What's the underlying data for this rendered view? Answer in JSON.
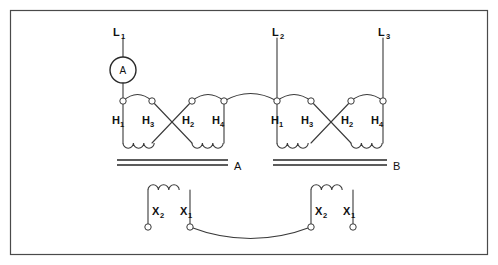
{
  "diagram": {
    "background_color": "#ffffff",
    "line_color": "#3a3a3a",
    "frame": {
      "x": 10,
      "y": 10,
      "width": 478,
      "height": 245
    },
    "line_labels": [
      {
        "name": "L1",
        "text": "L",
        "sub": "1",
        "x": 118,
        "y": 32
      },
      {
        "name": "L2",
        "text": "L",
        "sub": "2",
        "x": 277,
        "y": 32
      },
      {
        "name": "L3",
        "text": "L",
        "sub": "3",
        "x": 381,
        "y": 32
      }
    ],
    "meter": {
      "name": "ammeter",
      "label": "A",
      "cx": 123,
      "cy": 70,
      "r": 13
    },
    "transformers": [
      {
        "name": "transformer-a",
        "core_label": "A",
        "core_label_x": 234,
        "core_label_y": 170,
        "primary_terminals": [
          {
            "label": "H",
            "sub": "1",
            "x": 118,
            "y": 101
          },
          {
            "label": "H",
            "sub": "3",
            "x": 152,
            "y": 101
          },
          {
            "label": "H",
            "sub": "2",
            "x": 192,
            "y": 101
          },
          {
            "label": "H",
            "sub": "4",
            "x": 224,
            "y": 101
          }
        ],
        "secondary_terminals": [
          {
            "label": "X",
            "sub": "2",
            "x": 148,
            "y": 227
          },
          {
            "label": "X",
            "sub": "1",
            "x": 190,
            "y": 227
          }
        ]
      },
      {
        "name": "transformer-b",
        "core_label": "B",
        "core_label_x": 393,
        "core_label_y": 170,
        "primary_terminals": [
          {
            "label": "H",
            "sub": "1",
            "x": 277,
            "y": 101
          },
          {
            "label": "H",
            "sub": "3",
            "x": 311,
            "y": 101
          },
          {
            "label": "H",
            "sub": "2",
            "x": 351,
            "y": 101
          },
          {
            "label": "H",
            "sub": "4",
            "x": 383,
            "y": 101
          }
        ],
        "secondary_terminals": [
          {
            "label": "X",
            "sub": "2",
            "x": 311,
            "y": 227
          },
          {
            "label": "X",
            "sub": "1",
            "x": 353,
            "y": 227
          }
        ]
      }
    ],
    "labels": {
      "l1": "L",
      "l1_sub": "1",
      "l2": "L",
      "l2_sub": "2",
      "l3": "L",
      "l3_sub": "3",
      "meter": "A",
      "core_a": "A",
      "core_b": "B",
      "h1": "H",
      "h1_sub": "1",
      "h3": "H",
      "h3_sub": "3",
      "h2": "H",
      "h2_sub": "2",
      "h4": "H",
      "h4_sub": "4",
      "x1": "X",
      "x1_sub": "1",
      "x2": "X",
      "x2_sub": "2"
    }
  }
}
